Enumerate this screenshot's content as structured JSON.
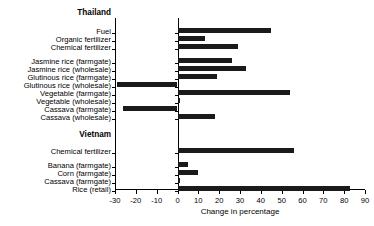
{
  "chart_data": {
    "type": "bar",
    "orientation": "horizontal",
    "title": "",
    "xlabel": "Change in percentage",
    "ylabel": "",
    "xlim": [
      -30,
      90
    ],
    "xticks": [
      -30,
      -20,
      -10,
      0,
      10,
      20,
      30,
      40,
      50,
      60,
      70,
      80,
      90
    ],
    "xtick_labels": [
      "-30",
      "-20",
      "-10",
      "0",
      "10",
      "20",
      "30",
      "40",
      "50",
      "60",
      "70",
      "80",
      "90"
    ],
    "grid": false,
    "legend": null,
    "zero_reference_line": 0,
    "bar_color": "#1a1a1a",
    "groups": [
      {
        "name": "Thailand",
        "categories": [
          "Fuel",
          "Organic fertilizer",
          "Chemical fertilizer",
          "Jasmine rice (farmgate)",
          "Jasmine rice (wholesale)",
          "Glutinous rice (farmgate)",
          "Glutinous rice (wholesale)",
          "Vegetable (farmgate)",
          "Vegetable (wholesale)",
          "Cassava (farmgate)",
          "Cassava (wholesale)"
        ],
        "values": [
          45,
          13,
          29,
          26,
          33,
          19,
          -29,
          54,
          1,
          -26,
          18
        ]
      },
      {
        "name": "Vietnam",
        "categories": [
          "Chemical fertilizer",
          "Banana (farmgate)",
          "Corn (farmgate)",
          "Cassava (farmgate)",
          "Rice (retail)"
        ],
        "values": [
          56,
          5,
          10,
          1,
          83
        ]
      }
    ],
    "categories": [
      "Thailand",
      "Fuel",
      "Organic fertilizer",
      "Chemical fertilizer",
      "Jasmine rice (farmgate)",
      "Jasmine rice (wholesale)",
      "Glutinous rice (farmgate)",
      "Glutinous rice (wholesale)",
      "Vegetable (farmgate)",
      "Vegetable (wholesale)",
      "Cassava (farmgate)",
      "Cassava (wholesale)",
      "Vietnam",
      "Chemical fertilizer",
      "Banana (farmgate)",
      "Corn (farmgate)",
      "Cassava (farmgate)",
      "Rice (retail)"
    ],
    "values": [
      null,
      45,
      13,
      29,
      26,
      33,
      19,
      -29,
      54,
      1,
      -26,
      18,
      null,
      56,
      5,
      10,
      1,
      83
    ]
  },
  "rows": [
    {
      "label": "Thailand",
      "is_group": true,
      "value": null,
      "y": 14
    },
    {
      "label": "Fuel",
      "is_group": false,
      "value": 45,
      "y": 33
    },
    {
      "label": "Organic fertilizer",
      "is_group": false,
      "value": 13,
      "y": 41
    },
    {
      "label": "Chemical fertilizer",
      "is_group": false,
      "value": 29,
      "y": 49
    },
    {
      "label": "Jasmine rice (farmgate)",
      "is_group": false,
      "value": 26,
      "y": 63
    },
    {
      "label": "Jasmine rice (wholesale)",
      "is_group": false,
      "value": 33,
      "y": 71
    },
    {
      "label": "Glutinous rice (farmgate)",
      "is_group": false,
      "value": 19,
      "y": 79
    },
    {
      "label": "Glutinous rice (wholesale)",
      "is_group": false,
      "value": -29,
      "y": 87
    },
    {
      "label": "Vegetable (farmgate)",
      "is_group": false,
      "value": 54,
      "y": 95
    },
    {
      "label": "Vegetable (wholesale)",
      "is_group": false,
      "value": 1,
      "y": 103
    },
    {
      "label": "Cassava (farmgate)",
      "is_group": false,
      "value": -26,
      "y": 111
    },
    {
      "label": "Cassava (wholesale)",
      "is_group": false,
      "value": 18,
      "y": 119
    },
    {
      "label": "Vietnam",
      "is_group": true,
      "value": null,
      "y": 136
    },
    {
      "label": "Chemical fertilizer",
      "is_group": false,
      "value": 56,
      "y": 153
    },
    {
      "label": "Banana (farmgate)",
      "is_group": false,
      "value": 5,
      "y": 167
    },
    {
      "label": "Corn (farmgate)",
      "is_group": false,
      "value": 10,
      "y": 175
    },
    {
      "label": "Cassava (farmgate)",
      "is_group": false,
      "value": 1,
      "y": 183
    },
    {
      "label": "Rice (retail)",
      "is_group": false,
      "value": 83,
      "y": 191
    }
  ],
  "axis": {
    "title": "Change in percentage",
    "ticks": [
      "-30",
      "-20",
      "-10",
      "0",
      "10",
      "20",
      "30",
      "40",
      "50",
      "60",
      "70",
      "80",
      "90"
    ]
  }
}
